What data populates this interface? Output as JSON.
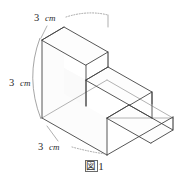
{
  "figure": {
    "caption_symbol": "図",
    "caption_number": "1",
    "shape": "three-step staircase solid (isometric)",
    "dimensions": [
      {
        "id": "top-depth",
        "value": "3",
        "unit": "cm",
        "label": "3 cm",
        "position": "upper-left"
      },
      {
        "id": "left-height",
        "value": "3",
        "unit": "cm",
        "label": "3 cm",
        "position": "mid-left"
      },
      {
        "id": "bottom-width",
        "value": "3",
        "unit": "cm",
        "label": "3 cm",
        "position": "lower-left"
      }
    ],
    "dim_top": {
      "number": "3",
      "unit": "cm"
    },
    "dim_left": {
      "number": "3",
      "unit": "cm"
    },
    "dim_bottom": {
      "number": "3",
      "unit": "cm"
    },
    "colors": {
      "edge": "#444444",
      "hidden_edge": "#9a9a9a",
      "leader": "#8e8e8e",
      "text": "#2b2b2b",
      "background": "#ffffff"
    }
  }
}
